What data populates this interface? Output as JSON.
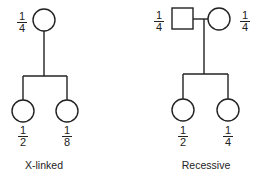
{
  "pedigrees": [
    {
      "id": "x-linked",
      "caption": "X-linked",
      "parents": [
        {
          "shape": "circle",
          "sex": "female",
          "probability": {
            "num": "1",
            "den": "4"
          }
        }
      ],
      "children": [
        {
          "shape": "circle",
          "sex": "female",
          "probability": {
            "num": "1",
            "den": "2"
          }
        },
        {
          "shape": "circle",
          "sex": "female",
          "probability": {
            "num": "1",
            "den": "8"
          }
        }
      ]
    },
    {
      "id": "recessive",
      "caption": "Recessive",
      "parents": [
        {
          "shape": "square",
          "sex": "male",
          "probability": {
            "num": "1",
            "den": "4"
          }
        },
        {
          "shape": "circle",
          "sex": "female",
          "probability": {
            "num": "1",
            "den": "4"
          }
        }
      ],
      "children": [
        {
          "shape": "circle",
          "sex": "female",
          "probability": {
            "num": "1",
            "den": "2"
          }
        },
        {
          "shape": "circle",
          "sex": "female",
          "probability": {
            "num": "1",
            "den": "4"
          }
        }
      ]
    }
  ],
  "colors": {
    "stroke": "#222222",
    "background": "#ffffff"
  }
}
